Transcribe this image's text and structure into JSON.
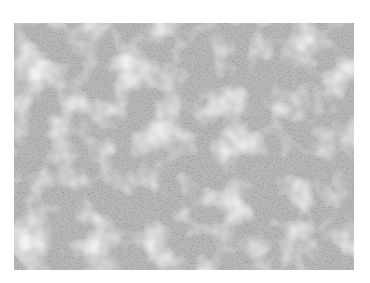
{
  "image": {
    "description": "Grayscale histology micrograph showing densely packed small round cells with lighter stromal areas",
    "tone": "grayscale",
    "background_color": "#ffffff",
    "base_color": "#b4b4b4",
    "nucleus_color": "#555555",
    "light_region_color": "#d8d8d8"
  }
}
